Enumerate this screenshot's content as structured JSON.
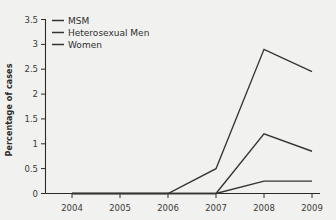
{
  "chart_data": {
    "type": "line",
    "title": "",
    "xlabel": "",
    "ylabel": "Percentage of cases",
    "x": [
      2004,
      2005,
      2006,
      2007,
      2008,
      2009
    ],
    "xticklabels": [
      "2004",
      "2005",
      "2006",
      "2007",
      "2008",
      "2009"
    ],
    "yticklabels": [
      "0",
      "0.5",
      "1",
      "1.5",
      "2",
      "2.5",
      "3",
      "3.5"
    ],
    "yticks": [
      0,
      0.5,
      1,
      1.5,
      2,
      2.5,
      3,
      3.5
    ],
    "ylim": [
      0,
      3.5
    ],
    "xlim": [
      2003.6,
      2009.4
    ],
    "grid": false,
    "legend_position": "top-left",
    "series": [
      {
        "name": "MSM",
        "color": "#343434",
        "values": [
          0,
          0,
          0,
          0.5,
          2.9,
          2.45
        ]
      },
      {
        "name": "Heterosexual Men",
        "color": "#343434",
        "values": [
          0,
          0,
          0,
          0,
          1.2,
          0.85
        ]
      },
      {
        "name": "Women",
        "color": "#343434",
        "values": [
          0,
          0,
          0,
          0,
          0.25,
          0.25
        ]
      }
    ]
  },
  "axes": {
    "ylabel": "Percentage of cases",
    "ytick_0": "0",
    "ytick_1": "0.5",
    "ytick_2": "1",
    "ytick_3": "1.5",
    "ytick_4": "2",
    "ytick_5": "2.5",
    "ytick_6": "3",
    "ytick_7": "3.5",
    "xtick_0": "2004",
    "xtick_1": "2005",
    "xtick_2": "2006",
    "xtick_3": "2007",
    "xtick_4": "2008",
    "xtick_5": "2009"
  },
  "legend": {
    "entry_0": "MSM",
    "entry_1": "Heterosexual Men",
    "entry_2": "Women"
  },
  "colors": {
    "background": "#f1f1ef",
    "line": "#343434",
    "axis": "#2b2b2b",
    "text": "#2f2f2f"
  }
}
